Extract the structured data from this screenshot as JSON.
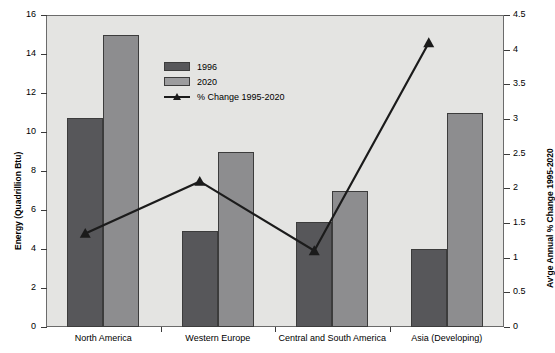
{
  "chart_data": {
    "type": "bar",
    "title": "",
    "subtitle": "",
    "categories": [
      "North America",
      "Western Europe",
      "Central and South America",
      "Asia (Developing)"
    ],
    "series": [
      {
        "name": "1996",
        "axis": "left",
        "values": [
          10.7,
          4.9,
          5.4,
          4.0
        ],
        "color": "#57575A"
      },
      {
        "name": "2020",
        "axis": "left",
        "values": [
          15.0,
          9.0,
          7.0,
          11.0
        ],
        "color": "#8D8D8F"
      },
      {
        "name": "% Change 1995-2020",
        "axis": "right",
        "type": "line",
        "values": [
          1.35,
          2.1,
          1.1,
          4.1
        ],
        "color": "#1B1B1B"
      }
    ],
    "xlabel": "",
    "ylabel": "Energy (Quadrillion Btu)",
    "y2label": "Av'ge Annual % Change 1995-2020",
    "ylim": [
      0,
      16
    ],
    "y2lim": [
      0,
      4.5
    ],
    "yticks": [
      "0",
      "2",
      "4",
      "6",
      "8",
      "10",
      "12",
      "14",
      "16"
    ],
    "y2ticks": [
      "0",
      "0.5",
      "1",
      "1.5",
      "2",
      "2.5",
      "3",
      "3.5",
      "4",
      "4.5"
    ],
    "grid": false,
    "legend_position": "inside-top-center",
    "plot_background": "#E4E4E2",
    "legend": [
      "1996",
      "2020",
      "% Change 1995-2020"
    ]
  }
}
